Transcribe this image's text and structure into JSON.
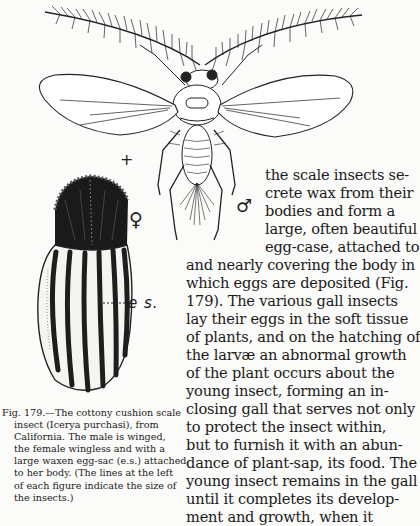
{
  "figure": {
    "number": "Fig. 179",
    "symbols": {
      "scale_mark": "+",
      "male": "♂",
      "female": "♀",
      "egg_sac_label": "e s."
    },
    "caption": {
      "lines": [
        "Fig. 179.—The cottony cushion scale",
        "insect (Icerya purchasi), from",
        "California. The male is winged,",
        "the female wingless and with a",
        "large waxen egg-sac (e.s.) attached",
        "to her body. (The lines at the left",
        "of each figure indicate the size of",
        "the insects.)"
      ]
    }
  },
  "body_text": {
    "lines": [
      "the scale insects se-",
      "crete wax from their",
      "bodies and form a",
      "large, often beautiful",
      "egg-case, attached to",
      "and nearly covering the body in",
      "which eggs are deposited (Fig.",
      "179). The various gall insects",
      "lay their eggs in the soft tissue",
      "of plants, and on the hatching of",
      "the larvæ an abnormal growth",
      "of the plant occurs about the",
      "young insect, forming an in-",
      "closing gall that serves not only",
      "to protect the insect within,",
      "but to furnish it with an abun-",
      "dance of plant-sap, its food. The",
      "young insect remains in the gall",
      "until it completes its develop-",
      "ment and growth, when it"
    ]
  }
}
